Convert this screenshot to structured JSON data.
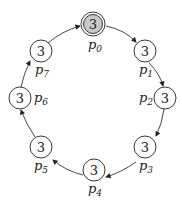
{
  "diagram": {
    "type": "ring",
    "nodes": [
      {
        "id": "p0",
        "label": "p",
        "sub": "0",
        "value": "3",
        "highlighted": true
      },
      {
        "id": "p1",
        "label": "p",
        "sub": "1",
        "value": "3"
      },
      {
        "id": "p2",
        "label": "p",
        "sub": "2",
        "value": "3"
      },
      {
        "id": "p3",
        "label": "p",
        "sub": "3",
        "value": "3"
      },
      {
        "id": "p4",
        "label": "p",
        "sub": "4",
        "value": "3"
      },
      {
        "id": "p5",
        "label": "p",
        "sub": "5",
        "value": "3"
      },
      {
        "id": "p6",
        "label": "p",
        "sub": "6",
        "value": "3"
      },
      {
        "id": "p7",
        "label": "p",
        "sub": "7",
        "value": "3"
      }
    ],
    "edges": [
      [
        "p0",
        "p1"
      ],
      [
        "p1",
        "p2"
      ],
      [
        "p2",
        "p3"
      ],
      [
        "p3",
        "p4"
      ],
      [
        "p4",
        "p5"
      ],
      [
        "p5",
        "p6"
      ],
      [
        "p6",
        "p7"
      ],
      [
        "p7",
        "p0"
      ]
    ],
    "colors": {
      "highlight_fill": "#c8c8c8",
      "stroke": "#222222"
    }
  }
}
